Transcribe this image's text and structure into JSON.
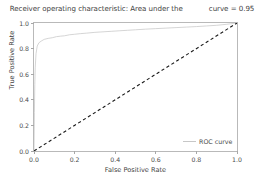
{
  "chart_data": {
    "type": "line",
    "title": "Receiver operating characteristic: Area under the",
    "title_part2": "curve = 0.95",
    "xlabel": "False Positive Rate",
    "ylabel": "True Positive Rate",
    "xlim": [
      0.0,
      1.0
    ],
    "ylim": [
      0.0,
      1.0
    ],
    "xticks": [
      "0.0",
      "0.2",
      "0.4",
      "0.6",
      "0.8",
      "1.0"
    ],
    "xtick_values": [
      0.0,
      0.2,
      0.4,
      0.6,
      0.8,
      1.0
    ],
    "yticks": [
      "0.0",
      "0.2",
      "0.4",
      "0.6",
      "0.8",
      "1.0"
    ],
    "ytick_values": [
      0.0,
      0.2,
      0.4,
      0.6,
      0.8,
      1.0
    ],
    "grid": false,
    "legend_position": "lower right",
    "auc": 0.95,
    "series": [
      {
        "name": "ROC curve",
        "color": "#c7c7c7",
        "style": "solid",
        "x": [
          0.0,
          0.002,
          0.004,
          0.006,
          0.01,
          0.016,
          0.024,
          0.035,
          0.05,
          0.07,
          0.09,
          0.11,
          0.13,
          0.15,
          0.175,
          0.2,
          0.23,
          0.26,
          0.3,
          0.34,
          0.38,
          0.42,
          0.46,
          0.5,
          0.55,
          0.6,
          0.65,
          0.7,
          0.75,
          0.8,
          0.85,
          0.9,
          0.95,
          1.0
        ],
        "y": [
          0.0,
          0.3,
          0.52,
          0.65,
          0.76,
          0.82,
          0.845,
          0.858,
          0.872,
          0.88,
          0.885,
          0.893,
          0.897,
          0.9,
          0.908,
          0.912,
          0.917,
          0.921,
          0.927,
          0.931,
          0.935,
          0.939,
          0.943,
          0.947,
          0.952,
          0.956,
          0.96,
          0.964,
          0.968,
          0.972,
          0.977,
          0.982,
          0.99,
          1.0
        ]
      },
      {
        "name": "chance-baseline",
        "color": "#1a1a1a",
        "style": "dashed",
        "x": [
          0.0,
          1.0
        ],
        "y": [
          0.0,
          1.0
        ]
      }
    ],
    "legend": [
      {
        "label": "ROC curve",
        "color": "#c7c7c7",
        "style": "solid"
      }
    ]
  }
}
